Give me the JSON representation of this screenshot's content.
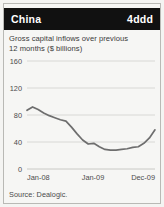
{
  "header": {
    "title": "China",
    "badge": "4ddd"
  },
  "subtitle_line1": "Gross capital inflows over previous",
  "subtitle_line2": "12 months ($ billions)",
  "source": "Source: Dealogic.",
  "colors": {
    "header_background": "#111111",
    "header_text": "#ffffff",
    "panel_background": "#f6f6f4",
    "grid": "#d2d2ce",
    "line": "#6e6e6e",
    "text": "#3a3a3a",
    "border": "#b9b9b5"
  },
  "chart_data": {
    "type": "line",
    "title": "China",
    "subtitle": "Gross capital inflows over previous 12 months ($ billions)",
    "xlabel": "",
    "ylabel": "",
    "ylim": [
      0,
      160
    ],
    "yticks": [
      0,
      40,
      80,
      120,
      160
    ],
    "ytick_labels": [
      "0",
      "40",
      "80",
      "120",
      "160"
    ],
    "xtick_labels": [
      "Jan-08",
      "Jan-09",
      "Dec-09"
    ],
    "xtick_positions": [
      0,
      12,
      23
    ],
    "grid": true,
    "legend": "none",
    "x": [
      "Jan-08",
      "Feb-08",
      "Mar-08",
      "Apr-08",
      "May-08",
      "Jun-08",
      "Jul-08",
      "Aug-08",
      "Sep-08",
      "Oct-08",
      "Nov-08",
      "Dec-08",
      "Jan-09",
      "Feb-09",
      "Mar-09",
      "Apr-09",
      "May-09",
      "Jun-09",
      "Jul-09",
      "Aug-09",
      "Sep-09",
      "Oct-09",
      "Nov-09",
      "Dec-09"
    ],
    "series": [
      {
        "name": "Gross capital inflows",
        "values": [
          87,
          92,
          88,
          83,
          79,
          76,
          73,
          71,
          62,
          52,
          43,
          37,
          38,
          33,
          29,
          28,
          28,
          29,
          30,
          32,
          33,
          38,
          46,
          58
        ]
      }
    ],
    "source": "Dealogic"
  }
}
